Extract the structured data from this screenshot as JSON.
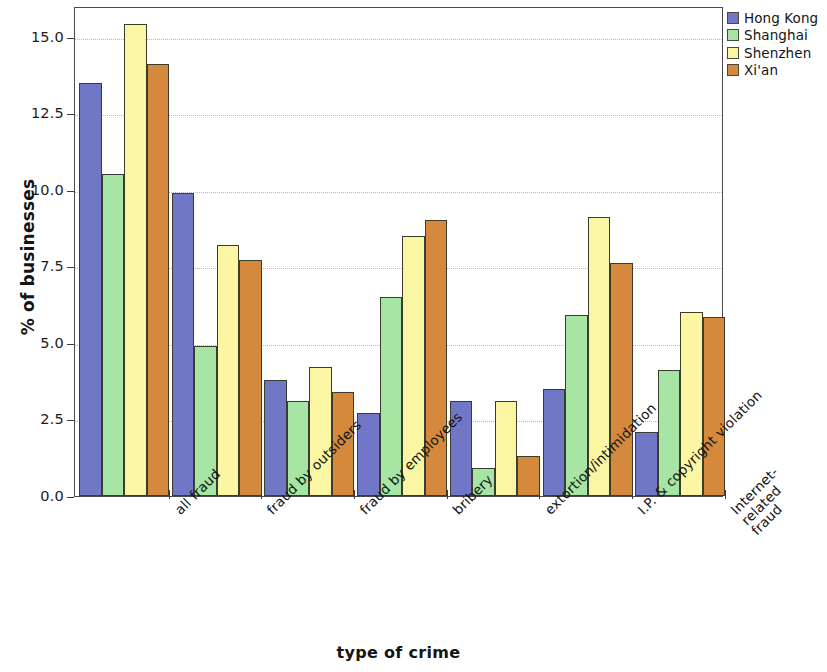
{
  "chart_data": {
    "type": "bar",
    "title": "",
    "xlabel": "type of crime",
    "ylabel": "% of businesses",
    "ylim": [
      0.0,
      16.0
    ],
    "yticks": [
      "0.0",
      "2.5",
      "5.0",
      "7.5",
      "10.0",
      "12.5",
      "15.0"
    ],
    "ytick_values": [
      0.0,
      2.5,
      5.0,
      7.5,
      10.0,
      12.5,
      15.0
    ],
    "grid": true,
    "legend_position": "upper right outside",
    "categories": [
      "all fraud",
      "fraud by outsiders",
      "fraud by employees",
      "bribery",
      "extortion/intimidation",
      "I.P. & copyright violation",
      "Internet-\nrelated\nfraud"
    ],
    "series": [
      {
        "name": "Hong Kong",
        "color": "#6f77c6",
        "values": [
          13.5,
          9.9,
          3.8,
          2.7,
          3.1,
          3.5,
          2.1
        ]
      },
      {
        "name": "Shanghai",
        "color": "#a6e5a3",
        "values": [
          10.5,
          4.9,
          3.1,
          6.5,
          0.9,
          5.9,
          4.1
        ]
      },
      {
        "name": "Shenzhen",
        "color": "#fbf6a4",
        "values": [
          15.4,
          8.2,
          4.2,
          8.5,
          3.1,
          9.1,
          6.0
        ]
      },
      {
        "name": "Xi'an",
        "color": "#d4893c",
        "values": [
          14.1,
          7.7,
          3.4,
          9.0,
          1.3,
          7.6,
          5.85
        ]
      }
    ]
  },
  "legend": {
    "items": [
      {
        "label": "Hong Kong",
        "color": "#6f77c6"
      },
      {
        "label": "Shanghai",
        "color": "#a6e5a3"
      },
      {
        "label": "Shenzhen",
        "color": "#fbf6a4"
      },
      {
        "label": "Xi'an",
        "color": "#d4893c"
      }
    ]
  }
}
